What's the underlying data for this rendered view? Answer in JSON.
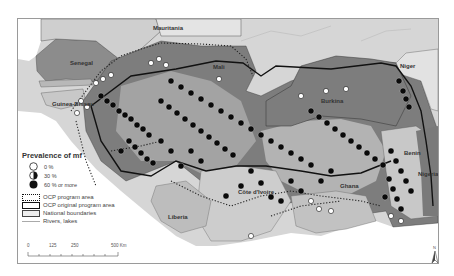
{
  "map": {
    "title": "Prevalence of mf in OCP area, West Africa",
    "countries": [
      {
        "id": "mauritania",
        "label": "Mauritania",
        "x": 152,
        "y": 27
      },
      {
        "id": "senegal",
        "label": "Senegal",
        "x": 70,
        "y": 61
      },
      {
        "id": "mali",
        "label": "Mali",
        "x": 212,
        "y": 65
      },
      {
        "id": "niger",
        "label": "Niger",
        "x": 397,
        "y": 65
      },
      {
        "id": "guinea-bissau",
        "label": "Guinea-Bissau",
        "x": 50,
        "y": 103
      },
      {
        "id": "burkina",
        "label": "Burkina",
        "x": 322,
        "y": 99
      },
      {
        "id": "benin",
        "label": "Benin",
        "x": 401,
        "y": 151
      },
      {
        "id": "nigeria",
        "label": "Nigeria",
        "x": 420,
        "y": 172
      },
      {
        "id": "ghana",
        "label": "Ghana",
        "x": 343,
        "y": 184
      },
      {
        "id": "cote-divoire",
        "label": "Côte d'Ivoire",
        "x": 240,
        "y": 190
      },
      {
        "id": "liberia",
        "label": "Liberia",
        "x": 167,
        "y": 215
      }
    ]
  },
  "legend": {
    "title": "Prevalence of mf",
    "items": [
      {
        "label": "0 %",
        "symbol": "empty-circle"
      },
      {
        "label": "30 %",
        "symbol": "half-circle"
      },
      {
        "label": "60 % or more",
        "symbol": "filled-circle"
      }
    ],
    "lines": [
      {
        "label": "OCP program area",
        "style": "dotted-box"
      },
      {
        "label": "OCP original program area",
        "style": "thick-box"
      },
      {
        "label": "National boundaries",
        "style": "thin-box"
      },
      {
        "label": "Rivers, lakes",
        "style": "thin-line"
      }
    ]
  },
  "scalebar": {
    "ticks": [
      "0",
      "125",
      "250",
      "500 Km"
    ]
  },
  "north_arrow": {
    "label": "N"
  },
  "colors": {
    "program_area": "#7a7a7a",
    "original_area": "#a8a8a8",
    "outside": "#d9d9d9",
    "ocean": "#ffffff",
    "site_dot": "#0a0a0a"
  }
}
